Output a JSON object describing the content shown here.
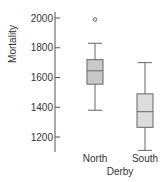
{
  "chart_data": {
    "type": "box",
    "title": "",
    "xlabel": "Derby",
    "ylabel": "Mortality",
    "ylim": [
      1050,
      2050
    ],
    "yticks": [
      1200,
      1400,
      1600,
      1800,
      2000
    ],
    "ytick_labels": [
      "1200",
      "1400",
      "1600",
      "1800",
      "2000"
    ],
    "grid": false,
    "legend": null,
    "categories": [
      "North",
      "South"
    ],
    "series": [
      {
        "name": "North",
        "whisker_low": 1380,
        "q1": 1555,
        "median": 1645,
        "q3": 1720,
        "whisker_high": 1830,
        "outliers": [
          1990
        ],
        "fill": "#c8c8c8"
      },
      {
        "name": "South",
        "whisker_low": 1110,
        "q1": 1265,
        "median": 1370,
        "q3": 1490,
        "whisker_high": 1700,
        "outliers": [],
        "fill": "#dcdcdc"
      }
    ]
  },
  "colors": {
    "axis": "#555555",
    "box_stroke": "#666666",
    "north_fill": "#c8c8c8",
    "south_fill": "#dcdcdc"
  }
}
